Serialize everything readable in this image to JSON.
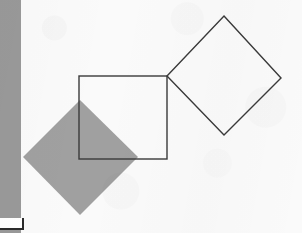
{
  "page": {
    "width": 302,
    "height": 233,
    "background_color": "#fafafa"
  },
  "sidebar": {
    "name": "left-gray-bar",
    "color": "#999999",
    "x": 0,
    "y": 0,
    "width": 21,
    "height": 233,
    "marker": {
      "name": "white-marker-box",
      "fill": "#ffffff",
      "border_color": "#2b2b2b",
      "x": 0,
      "y": 218,
      "width": 22,
      "height": 10
    }
  },
  "chart_data": {
    "type": "diagram",
    "stroke_color": "#3a3a3a",
    "stroke_width": 1.4,
    "fill_gray": "#a0a0a0",
    "shapes": [
      {
        "name": "shaded-rotated-square",
        "label": "Gray filled diamond",
        "kind": "polygon",
        "fill": "#a0a0a0",
        "stroke": "none",
        "points": [
          [
            80,
            100
          ],
          [
            138,
            157
          ],
          [
            80,
            215
          ],
          [
            23,
            157
          ]
        ],
        "center": [
          80.5,
          157.5
        ],
        "diagonal": 115,
        "side_length": 81
      },
      {
        "name": "outlined-square",
        "label": "Axis-aligned outlined square",
        "kind": "rect",
        "fill": "none",
        "stroke": "#3a3a3a",
        "x": 79,
        "y": 76,
        "width": 88,
        "height": 83
      },
      {
        "name": "outlined-rotated-square",
        "label": "Outlined diamond",
        "kind": "polygon",
        "fill": "none",
        "stroke": "#3a3a3a",
        "points": [
          [
            224,
            16
          ],
          [
            281,
            78
          ],
          [
            224,
            135
          ],
          [
            167,
            76
          ]
        ],
        "center": [
          224,
          75.5
        ],
        "diagonal": 114,
        "side_length": 84
      }
    ],
    "annotations": [],
    "legend": [],
    "grid": false
  }
}
